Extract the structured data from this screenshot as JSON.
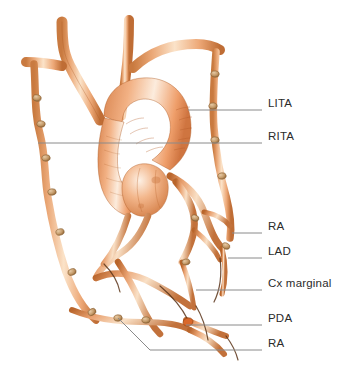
{
  "figure": {
    "kind": "anatomical-illustration",
    "background_color": "#ffffff"
  },
  "palette": {
    "vessel_light": "#f7d7ba",
    "vessel_mid": "#eba877",
    "vessel_deep": "#d9763f",
    "vessel_shadow": "#b4561f",
    "aorta_light": "#fae3cd",
    "aorta_mid": "#ef9f6b",
    "outline": "#8a4a20",
    "clip": "#c69a6a",
    "clip_dark": "#9a6c3c",
    "leader_line": "#8a8a8a",
    "label_text": "#2b2b2b"
  },
  "labels": [
    {
      "id": "lita",
      "text": "LITA",
      "text_x": 268,
      "text_y": 105,
      "line_y": 110,
      "line_x1": 188,
      "line_x2": 262
    },
    {
      "id": "rita",
      "text": "RITA",
      "text_x": 268,
      "text_y": 138,
      "line_y": 143,
      "line_x1": 38,
      "line_x2": 262
    },
    {
      "id": "ra_upper",
      "text": "RA",
      "text_x": 268,
      "text_y": 228,
      "line_y": 233,
      "line_x1": 232,
      "line_x2": 262
    },
    {
      "id": "lad",
      "text": "LAD",
      "text_x": 268,
      "text_y": 253,
      "line_y": 258,
      "line_x1": 228,
      "line_x2": 262
    },
    {
      "id": "cx_marginal",
      "text": "Cx marginal",
      "text_x": 268,
      "text_y": 285,
      "line_y": 290,
      "line_x1": 196,
      "line_x2": 262
    },
    {
      "id": "pda",
      "text": "PDA",
      "text_x": 268,
      "text_y": 320,
      "line_y": 325,
      "line_x1": 186,
      "line_x2": 262
    },
    {
      "id": "ra_lower",
      "text": "RA",
      "text_x": 268,
      "text_y": 345,
      "line_y": 350,
      "line_x1": 118,
      "line_x2": 262
    }
  ],
  "structures": [
    {
      "id": "aortic-arch",
      "name": "Aortic arch"
    },
    {
      "id": "ascending-aorta",
      "name": "Ascending aorta"
    },
    {
      "id": "aortic-root",
      "name": "Aortic root and sinuses"
    },
    {
      "id": "brachiocephalic-trunk",
      "name": "Brachiocephalic trunk"
    },
    {
      "id": "left-common-carotid",
      "name": "Left common carotid artery"
    },
    {
      "id": "left-subclavian",
      "name": "Left subclavian artery"
    },
    {
      "id": "left-ita",
      "name": "Left internal thoracic artery"
    },
    {
      "id": "right-ita",
      "name": "Right internal thoracic artery"
    },
    {
      "id": "radial-graft",
      "name": "Radial artery graft"
    },
    {
      "id": "lad-graft",
      "name": "Left anterior descending graft"
    },
    {
      "id": "cx-marginal-graft",
      "name": "Circumflex marginal graft"
    },
    {
      "id": "pda-graft",
      "name": "Posterior descending artery graft"
    },
    {
      "id": "surgical-clips",
      "name": "Surgical clips along grafts"
    }
  ]
}
